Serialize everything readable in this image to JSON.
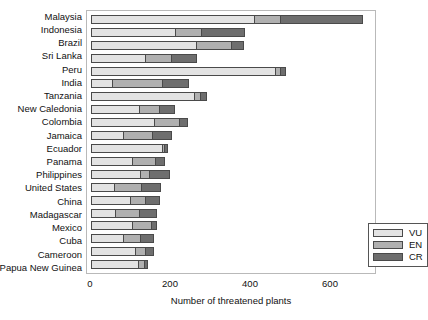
{
  "chart_data": {
    "type": "bar",
    "orientation": "horizontal",
    "stacked": true,
    "title": "",
    "xlabel": "Number of threatened plants",
    "ylabel": "",
    "xlim": [
      0,
      700
    ],
    "xticks": [
      0,
      200,
      400,
      600
    ],
    "grid": false,
    "legend_position": "lower-right-inside",
    "categories": [
      "Malaysia",
      "Indonesia",
      "Brazil",
      "Sri Lanka",
      "Peru",
      "India",
      "Tanzania",
      "New Caledonia",
      "Colombia",
      "Jamaica",
      "Ecuador",
      "Panama",
      "Philippines",
      "United States",
      "China",
      "Madagascar",
      "Mexico",
      "Cuba",
      "Cameroon",
      "Papua New Guinea"
    ],
    "series": [
      {
        "name": "VU",
        "color": "#e3e3e3",
        "values": [
          408,
          209,
          262,
          135,
          460,
          52,
          258,
          120,
          158,
          80,
          178,
          103,
          123,
          57,
          97,
          60,
          103,
          80,
          110,
          118
        ]
      },
      {
        "name": "EN",
        "color": "#b0b0b0",
        "values": [
          64,
          66,
          89,
          65,
          12,
          126,
          15,
          50,
          63,
          72,
          5,
          57,
          23,
          69,
          38,
          59,
          46,
          42,
          24,
          15
        ]
      },
      {
        "name": "CR",
        "color": "#6e6e6e",
        "values": [
          208,
          110,
          32,
          65,
          15,
          68,
          18,
          40,
          22,
          50,
          10,
          26,
          52,
          50,
          37,
          46,
          17,
          36,
          23,
          10
        ]
      }
    ],
    "totals": [
      680,
      385,
      383,
      265,
      487,
      246,
      291,
      210,
      243,
      202,
      193,
      186,
      198,
      176,
      172,
      165,
      166,
      158,
      157,
      143
    ]
  },
  "legend": {
    "entries": [
      {
        "label": "VU",
        "color": "#e3e3e3"
      },
      {
        "label": "EN",
        "color": "#b0b0b0"
      },
      {
        "label": "CR",
        "color": "#6e6e6e"
      }
    ]
  }
}
